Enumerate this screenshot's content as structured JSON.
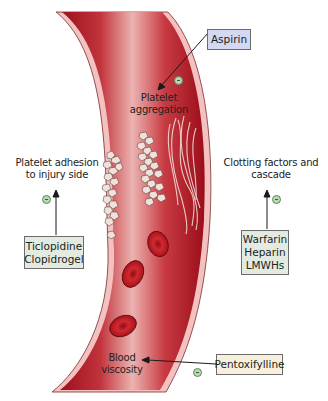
{
  "diagram": {
    "labels": {
      "platelet_aggregation": [
        "Platelet",
        "aggregation"
      ],
      "platelet_adhesion": [
        "Platelet adhesion",
        "to injury side"
      ],
      "clotting_factors": [
        "Clotting factors and",
        "cascade"
      ],
      "blood_viscosity": [
        "Blood",
        "viscosity"
      ]
    },
    "drug_boxes": {
      "aspirin": {
        "lines": [
          "Aspirin"
        ],
        "fill": "#d4d8f0"
      },
      "ticlopidine_clopidogrel": {
        "lines": [
          "Ticlopidine",
          "Clopidrogel"
        ],
        "fill": "#e3ebe1"
      },
      "warfarin_heparin_lmwhs": {
        "lines": [
          "Warfarin",
          "Heparin",
          "LMWHs"
        ],
        "fill": "#e3ebe1"
      },
      "pentoxifylline": {
        "lines": [
          "Pentoxifylline"
        ],
        "fill": "#f6f0dc"
      }
    },
    "inhibition_symbol": "−",
    "colors": {
      "vessel_dark": "#a3121f",
      "vessel_light": "#e9a6a6",
      "vessel_wall": "#f3c2c0",
      "platelet": "#efe1dc",
      "rbc": "#c0141f",
      "inhibit_circle": "#b9d6b5",
      "arrow": "#1a1a1a"
    }
  }
}
